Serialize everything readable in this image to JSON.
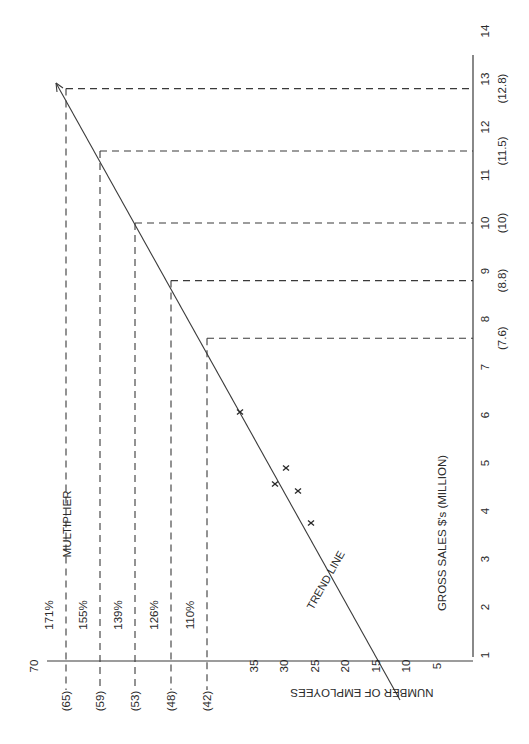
{
  "chart_data": {
    "type": "scatter",
    "orientation": "rotated 90 degrees counter-clockwise",
    "title": "",
    "xlabel": "GROSS SALES $'s (MILLION)",
    "ylabel": "NUMBER OF EMPLOYEES",
    "xlim": [
      1,
      14
    ],
    "ylim": [
      0,
      70
    ],
    "x_ticks": [
      "1",
      "2",
      "3",
      "4",
      "5",
      "6",
      "7",
      "8",
      "9",
      "10",
      "11",
      "12",
      "13",
      "14"
    ],
    "y_ticks": [
      "5",
      "10",
      "15",
      "20",
      "25",
      "30",
      "35",
      "70"
    ],
    "grid": false,
    "series": [
      {
        "name": "observations",
        "marker": "x",
        "points": [
          {
            "x": 3.75,
            "y": 25.5
          },
          {
            "x": 4.4,
            "y": 27.5
          },
          {
            "x": 4.55,
            "y": 31
          },
          {
            "x": 4.9,
            "y": 29.5
          },
          {
            "x": 6.05,
            "y": 37
          }
        ]
      },
      {
        "name": "TREND LINE",
        "type": "line",
        "points": [
          {
            "x": 0.1,
            "y": 11
          },
          {
            "x": 13.3,
            "y": 67
          }
        ]
      }
    ],
    "projections": [
      {
        "sales": 7.6,
        "sales_label": "(7.6)",
        "employees": 42,
        "employees_label": "(42)",
        "multiplier": "110%"
      },
      {
        "sales": 8.8,
        "sales_label": "(8.8)",
        "employees": 48,
        "employees_label": "(48)",
        "multiplier": "126%"
      },
      {
        "sales": 10,
        "sales_label": "(10)",
        "employees": 53,
        "employees_label": "(53)",
        "multiplier": "139%"
      },
      {
        "sales": 11.5,
        "sales_label": "(11.5)",
        "employees": 59,
        "employees_label": "(59)",
        "multiplier": "155%"
      },
      {
        "sales": 12.8,
        "sales_label": "(12.8)",
        "employees": 65,
        "employees_label": "(65)",
        "multiplier": "171%"
      }
    ],
    "annotations": {
      "multiplier_label": "MULTIPLIER",
      "trend_label": "TREND LINE"
    }
  }
}
